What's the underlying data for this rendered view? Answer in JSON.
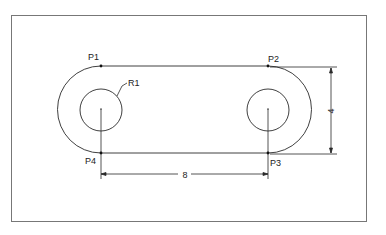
{
  "drawing": {
    "title": "Slot link with two holes",
    "colors": {
      "line": "#2a2a2a",
      "frame": "#777777",
      "background": "#ffffff"
    },
    "points": [
      {
        "label": "P1",
        "x": 101,
        "y": 66
      },
      {
        "label": "P2",
        "x": 268,
        "y": 66
      },
      {
        "label": "P3",
        "x": 268,
        "y": 153
      },
      {
        "label": "P4",
        "x": 101,
        "y": 153
      }
    ],
    "radius_label": "R1",
    "dimensions": {
      "horizontal": {
        "value": "8"
      },
      "vertical": {
        "value": "4"
      }
    }
  }
}
